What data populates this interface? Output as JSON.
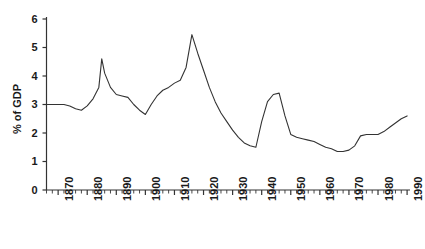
{
  "chart_data": {
    "type": "line",
    "title": "",
    "subtitle": "",
    "xlabel": "",
    "ylabel": "% of GDP",
    "xlim": [
      1866,
      1991
    ],
    "ylim": [
      0,
      6
    ],
    "grid": false,
    "legend_position": "none",
    "y_ticks": [
      0,
      1,
      2,
      3,
      4,
      5,
      6
    ],
    "y_tick_labels": [
      "0",
      "1",
      "2",
      "3",
      "4",
      "5",
      "6"
    ],
    "x_ticks": [
      1870,
      1880,
      1890,
      1900,
      1910,
      1920,
      1930,
      1940,
      1950,
      1960,
      1970,
      1980,
      1990
    ],
    "x_tick_labels": [
      "1870",
      "1880",
      "1890",
      "1900",
      "1910",
      "1920",
      "1930",
      "1940",
      "1950",
      "1960",
      "1970",
      "1980",
      "1990"
    ],
    "x_minor_tick_interval": 2,
    "line_color": "#333333",
    "line_width": 1.1,
    "series": [
      {
        "name": "% of GDP",
        "x": [
          1866,
          1868,
          1870,
          1872,
          1874,
          1876,
          1878,
          1880,
          1882,
          1884,
          1885,
          1886,
          1888,
          1890,
          1892,
          1894,
          1896,
          1898,
          1900,
          1902,
          1904,
          1906,
          1908,
          1910,
          1912,
          1914,
          1916,
          1918,
          1920,
          1922,
          1924,
          1926,
          1928,
          1930,
          1932,
          1934,
          1936,
          1938,
          1940,
          1942,
          1944,
          1946,
          1948,
          1950,
          1952,
          1954,
          1956,
          1958,
          1960,
          1962,
          1964,
          1966,
          1968,
          1970,
          1972,
          1974,
          1976,
          1978,
          1980,
          1982,
          1984,
          1986,
          1988,
          1990
        ],
        "y": [
          3.0,
          3.0,
          3.0,
          3.0,
          2.95,
          2.85,
          2.8,
          2.95,
          3.2,
          3.6,
          4.6,
          4.1,
          3.6,
          3.35,
          3.3,
          3.25,
          3.0,
          2.8,
          2.65,
          3.0,
          3.3,
          3.5,
          3.6,
          3.75,
          3.85,
          4.3,
          5.45,
          4.8,
          4.2,
          3.6,
          3.1,
          2.7,
          2.4,
          2.1,
          1.85,
          1.65,
          1.55,
          1.5,
          2.4,
          3.1,
          3.35,
          3.4,
          2.6,
          1.95,
          1.85,
          1.8,
          1.75,
          1.7,
          1.6,
          1.5,
          1.45,
          1.35,
          1.35,
          1.4,
          1.55,
          1.9,
          1.95,
          1.95,
          1.95,
          2.05,
          2.2,
          2.35,
          2.5,
          2.6
        ]
      }
    ]
  },
  "axis": {
    "y_title": "% of GDP"
  }
}
